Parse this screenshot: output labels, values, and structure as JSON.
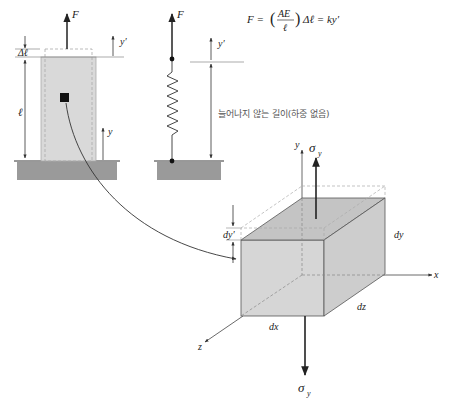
{
  "labels": {
    "force_bar": "F",
    "force_spring": "F",
    "delta_l": "Δℓ",
    "length": "ℓ",
    "y_bar": "y",
    "y_prime_bar": "y′",
    "y_prime_spring": "y′",
    "equation_lhs": "F = ",
    "equation_frac_num": "AE",
    "equation_frac_den": "ℓ",
    "equation_rhs": "Δℓ = ky′",
    "unstretched_length": "늘어나지 않는 길이(하중 없음)",
    "sigma_top": "σ",
    "sigma_top_sub": "y",
    "sigma_bottom": "σ",
    "sigma_bottom_sub": "y",
    "axis_x": "x",
    "axis_y": "y",
    "axis_z": "z",
    "dim_dx": "dx",
    "dim_dy": "dy",
    "dim_dz": "dz",
    "dim_dy_prime": "dy′"
  },
  "colors": {
    "ground": "#9a9a9a",
    "bar_fill": "#d9d9d9",
    "cube_front": "#d6d6d6",
    "cube_top": "#c4c4c4",
    "cube_side": "#cdcdcd",
    "line": "#333333",
    "dashed": "#aaaaaa"
  }
}
